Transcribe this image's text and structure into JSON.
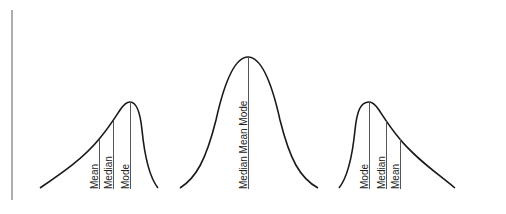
{
  "diagram": {
    "type": "skewness-distributions",
    "axes": {
      "color": "#777777",
      "x_axis_end_color": "#e06070"
    },
    "panels": [
      {
        "name": "negatively-skewed",
        "labels": {
          "mean": "Mean",
          "median": "Median",
          "mode": "Mode"
        }
      },
      {
        "name": "symmetric",
        "labels": {
          "combined": "Median Mean Mode"
        }
      },
      {
        "name": "positively-skewed",
        "labels": {
          "mode": "Mode",
          "median": "Median",
          "mean": "Mean"
        }
      }
    ]
  }
}
